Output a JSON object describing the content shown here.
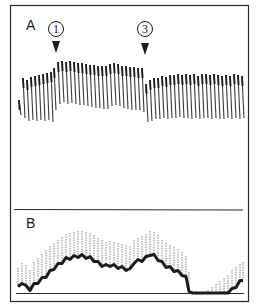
{
  "figure": {
    "border_color": "#2a2a2a",
    "trace_color": "#1a1a1a",
    "panels": [
      {
        "label": "A"
      },
      {
        "label": "B"
      }
    ],
    "markers": [
      {
        "number": "1",
        "glyph": "①",
        "x": 56
      },
      {
        "number": "3",
        "glyph": "③",
        "x": 145
      }
    ]
  },
  "chart_data": [
    {
      "type": "line",
      "title": "A",
      "description": "Oscillating recording trace; baseline shifts upward at marker 1 and returns downward at marker 3",
      "annotations": [
        "①",
        "③"
      ],
      "strokes": [
        [
          19,
          100,
          115
        ],
        [
          23,
          78,
          118
        ],
        [
          27,
          80,
          121
        ],
        [
          31,
          77,
          120
        ],
        [
          35,
          76,
          121
        ],
        [
          39,
          75,
          120
        ],
        [
          43,
          74,
          121
        ],
        [
          47,
          73,
          120
        ],
        [
          51,
          72,
          122
        ],
        [
          54,
          68,
          110
        ],
        [
          58,
          62,
          104
        ],
        [
          62,
          61,
          102
        ],
        [
          66,
          62,
          104
        ],
        [
          70,
          61,
          103
        ],
        [
          74,
          62,
          104
        ],
        [
          78,
          63,
          105
        ],
        [
          82,
          63,
          105
        ],
        [
          86,
          64,
          106
        ],
        [
          90,
          65,
          107
        ],
        [
          94,
          65,
          108
        ],
        [
          98,
          66,
          108
        ],
        [
          102,
          66,
          109
        ],
        [
          106,
          66,
          109
        ],
        [
          110,
          64,
          106
        ],
        [
          114,
          63,
          105
        ],
        [
          118,
          64,
          106
        ],
        [
          122,
          66,
          108
        ],
        [
          126,
          66,
          109
        ],
        [
          130,
          67,
          110
        ],
        [
          134,
          67,
          110
        ],
        [
          138,
          68,
          110
        ],
        [
          142,
          68,
          112
        ],
        [
          146,
          84,
          122
        ],
        [
          150,
          80,
          121
        ],
        [
          154,
          78,
          119
        ],
        [
          158,
          78,
          119
        ],
        [
          162,
          76,
          118
        ],
        [
          166,
          77,
          119
        ],
        [
          170,
          75,
          118
        ],
        [
          174,
          75,
          118
        ],
        [
          178,
          74,
          117
        ],
        [
          182,
          75,
          118
        ],
        [
          186,
          74,
          118
        ],
        [
          190,
          75,
          119
        ],
        [
          194,
          74,
          118
        ],
        [
          198,
          76,
          119
        ],
        [
          202,
          74,
          118
        ],
        [
          206,
          74,
          118
        ],
        [
          210,
          75,
          119
        ],
        [
          214,
          74,
          118
        ],
        [
          218,
          75,
          119
        ],
        [
          222,
          76,
          119
        ],
        [
          226,
          75,
          118
        ],
        [
          230,
          76,
          119
        ],
        [
          234,
          74,
          118
        ],
        [
          238,
          75,
          119
        ],
        [
          242,
          76,
          118
        ]
      ]
    },
    {
      "type": "line",
      "title": "B",
      "description": "Envelope trace with mean line and upward tick whiskers; rises, plateaus, dips, peaks, falls to baseline, then rises again",
      "baseline_y": 293,
      "points": [
        [
          18,
          288,
          268
        ],
        [
          22,
          282,
          263
        ],
        [
          26,
          287,
          265
        ],
        [
          30,
          289,
          270
        ],
        [
          34,
          285,
          262
        ],
        [
          38,
          282,
          258
        ],
        [
          42,
          279,
          254
        ],
        [
          46,
          276,
          250
        ],
        [
          50,
          272,
          246
        ],
        [
          54,
          268,
          243
        ],
        [
          58,
          265,
          240
        ],
        [
          62,
          262,
          237
        ],
        [
          66,
          259,
          234
        ],
        [
          70,
          258,
          233
        ],
        [
          74,
          257,
          232
        ],
        [
          78,
          256,
          231
        ],
        [
          82,
          256,
          231
        ],
        [
          86,
          257,
          232
        ],
        [
          90,
          258,
          233
        ],
        [
          94,
          260,
          235
        ],
        [
          98,
          263,
          238
        ],
        [
          102,
          265,
          240
        ],
        [
          106,
          266,
          242
        ],
        [
          110,
          265,
          241
        ],
        [
          114,
          266,
          242
        ],
        [
          118,
          267,
          243
        ],
        [
          122,
          268,
          244
        ],
        [
          126,
          269,
          245
        ],
        [
          130,
          270,
          246
        ],
        [
          134,
          262,
          240
        ],
        [
          138,
          261,
          238
        ],
        [
          142,
          260,
          236
        ],
        [
          146,
          258,
          234
        ],
        [
          150,
          254,
          231
        ],
        [
          154,
          256,
          232
        ],
        [
          158,
          259,
          235
        ],
        [
          162,
          263,
          240
        ],
        [
          166,
          266,
          243
        ],
        [
          170,
          268,
          245
        ],
        [
          174,
          270,
          247
        ],
        [
          178,
          272,
          249
        ],
        [
          182,
          274,
          252
        ],
        [
          186,
          278,
          256
        ],
        [
          189,
          290,
          272
        ],
        [
          192,
          293,
          290
        ],
        [
          196,
          293,
          291
        ],
        [
          200,
          293,
          293
        ],
        [
          204,
          293,
          293
        ],
        [
          208,
          293,
          290
        ],
        [
          212,
          293,
          287
        ],
        [
          216,
          293,
          284
        ],
        [
          220,
          293,
          281
        ],
        [
          224,
          293,
          278
        ],
        [
          228,
          293,
          275
        ],
        [
          232,
          290,
          270
        ],
        [
          236,
          286,
          267
        ],
        [
          240,
          282,
          264
        ],
        [
          243,
          279,
          262
        ]
      ]
    }
  ]
}
